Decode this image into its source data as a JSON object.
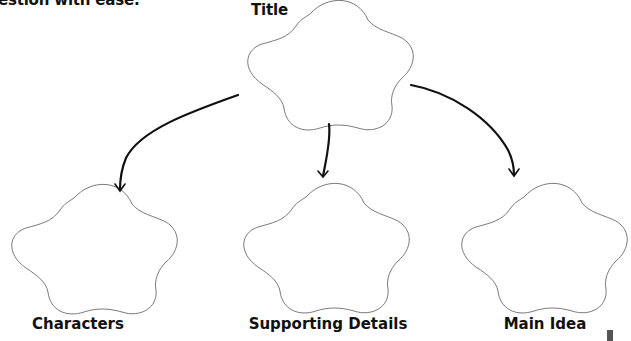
{
  "intro_text": "estion with ease.",
  "diagram": {
    "type": "story-map",
    "root": {
      "id": "title",
      "label": "Title"
    },
    "children": [
      {
        "id": "characters",
        "label": "Characters"
      },
      {
        "id": "supporting_details",
        "label": "Supporting Details"
      },
      {
        "id": "main_idea",
        "label": "Main Idea"
      }
    ],
    "edges": [
      {
        "from": "title",
        "to": "characters"
      },
      {
        "from": "title",
        "to": "supporting_details"
      },
      {
        "from": "title",
        "to": "main_idea"
      }
    ],
    "shape": "cloud",
    "colors": {
      "outline": "#6b6b6b",
      "arrow": "#111111",
      "text": "#111111",
      "background": "#ffffff"
    }
  }
}
